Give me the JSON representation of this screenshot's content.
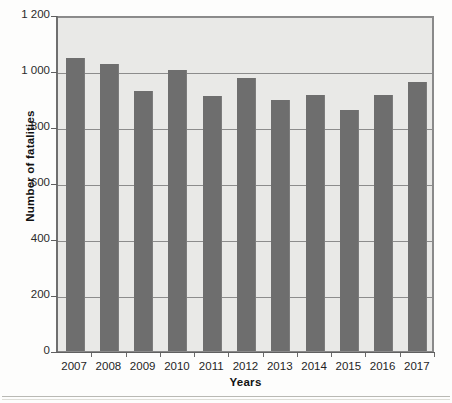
{
  "chart_data": {
    "type": "bar",
    "title": "",
    "xlabel": "Years",
    "ylabel": "Number of fatalities",
    "categories": [
      "2007",
      "2008",
      "2009",
      "2010",
      "2011",
      "2012",
      "2013",
      "2014",
      "2015",
      "2016",
      "2017"
    ],
    "values": [
      1045,
      1025,
      930,
      1005,
      910,
      975,
      895,
      915,
      860,
      915,
      960
    ],
    "series": [
      {
        "name": "Number of fatalities",
        "values": [
          1045,
          1025,
          930,
          1005,
          910,
          975,
          895,
          915,
          860,
          915,
          960
        ]
      }
    ],
    "ylim": [
      0,
      1200
    ],
    "y_ticks": [
      0,
      200,
      400,
      600,
      800,
      1000,
      1200
    ],
    "y_tick_labels": [
      "0",
      "200",
      "400",
      "600",
      "800",
      "1 000",
      "1 200"
    ],
    "grid": true,
    "gridlines_horizontal": true,
    "legend": false,
    "legend_position": "none",
    "bar_color": "#6e6e6e",
    "plot_background": "#e9e9e7",
    "gridline_color": "#8c8c8c",
    "axis_color": "#5f5f5f"
  },
  "axes": {
    "y_title": "Number of fatalities",
    "x_title": "Years"
  },
  "scan": {
    "bleed_text": "Road fatalities"
  }
}
